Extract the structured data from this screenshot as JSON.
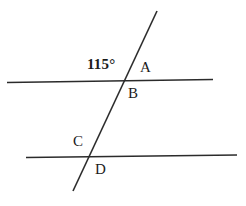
{
  "diagram": {
    "width": 246,
    "height": 206,
    "background_color": "#ffffff",
    "stroke_color": "#2b2b2b",
    "text_color": "#1b1b1b",
    "stroke_width": 1.6,
    "lines": [
      {
        "name": "upper-parallel-line",
        "role": "parallel-line-top",
        "x1": 7,
        "y1": 82.5,
        "x2": 213,
        "y2": 79.5
      },
      {
        "name": "lower-parallel-line",
        "role": "parallel-line-bottom",
        "x1": 26,
        "y1": 157.5,
        "x2": 237,
        "y2": 155.0
      },
      {
        "name": "transversal-line",
        "role": "transversal",
        "x1": 157,
        "y1": 11,
        "x2": 73,
        "y2": 191
      }
    ],
    "intersections": [
      {
        "name": "upper-intersection",
        "x": 124,
        "y": 81.8
      },
      {
        "name": "lower-intersection",
        "x": 91,
        "y": 156.4
      }
    ],
    "angle_labels": [
      {
        "id": "angle-115",
        "text": "115°",
        "value": 115,
        "unit": "degrees",
        "position": "above-left-of-upper-intersection",
        "x": 87,
        "y": 57
      }
    ],
    "point_labels": [
      {
        "id": "label-a",
        "text": "A",
        "position": "above-right-of-upper-intersection",
        "x": 140,
        "y": 60
      },
      {
        "id": "label-b",
        "text": "B",
        "position": "below-right-of-upper-intersection",
        "x": 128,
        "y": 86
      },
      {
        "id": "label-c",
        "text": "C",
        "position": "above-left-of-lower-intersection",
        "x": 73,
        "y": 134
      },
      {
        "id": "label-d",
        "text": "D",
        "position": "below-right-of-lower-intersection",
        "x": 95,
        "y": 162
      }
    ]
  }
}
